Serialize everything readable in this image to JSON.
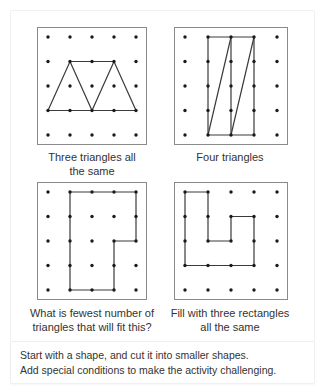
{
  "activities": [
    {
      "id": "three-triangles",
      "caption_line1": "Three triangles all",
      "caption_line2": "the same",
      "box": {
        "x": 37,
        "y": 27,
        "w": 108,
        "h": 116
      },
      "polylines": [
        [
          [
            0,
            3
          ],
          [
            1,
            1
          ],
          [
            3,
            1
          ],
          [
            4,
            3
          ],
          [
            0,
            3
          ]
        ],
        [
          [
            1,
            1
          ],
          [
            2,
            3
          ],
          [
            3,
            1
          ]
        ]
      ]
    },
    {
      "id": "four-triangles",
      "caption_line1": "Four triangles",
      "caption_line2": "",
      "box": {
        "x": 174,
        "y": 27,
        "w": 112,
        "h": 116
      },
      "polylines": [
        [
          [
            1,
            0
          ],
          [
            3,
            0
          ],
          [
            3,
            4
          ],
          [
            1,
            4
          ],
          [
            1,
            0
          ]
        ],
        [
          [
            2,
            0
          ],
          [
            2,
            4
          ]
        ],
        [
          [
            1,
            4
          ],
          [
            2,
            0
          ]
        ],
        [
          [
            2,
            4
          ],
          [
            3,
            0
          ]
        ]
      ]
    },
    {
      "id": "fewest-triangles",
      "caption_line1": "What is fewest number of",
      "caption_line2": "triangles that will fit this?",
      "box": {
        "x": 37,
        "y": 182,
        "w": 108,
        "h": 116
      },
      "polylines": [
        [
          [
            1,
            0
          ],
          [
            4,
            0
          ],
          [
            4,
            2
          ],
          [
            3,
            2
          ],
          [
            3,
            4
          ],
          [
            1,
            4
          ],
          [
            1,
            0
          ]
        ]
      ]
    },
    {
      "id": "three-rectangles",
      "caption_line1": "Fill with three rectangles",
      "caption_line2": "all the same",
      "box": {
        "x": 174,
        "y": 182,
        "w": 112,
        "h": 116
      },
      "polylines": [
        [
          [
            0,
            0
          ],
          [
            1,
            0
          ],
          [
            1,
            2
          ],
          [
            2,
            2
          ],
          [
            2,
            1
          ],
          [
            3,
            1
          ],
          [
            3,
            3
          ],
          [
            0,
            3
          ],
          [
            0,
            0
          ]
        ]
      ]
    }
  ],
  "grid": {
    "cols": 5,
    "rows": 5,
    "dot_color": "#1a1a1a",
    "line_color": "#3a3a3a",
    "border_color": "#8a8a8a"
  },
  "footer": {
    "line1": "Start with a shape, and cut it into smaller shapes.",
    "line2": "Add special conditions to make the activity challenging."
  }
}
